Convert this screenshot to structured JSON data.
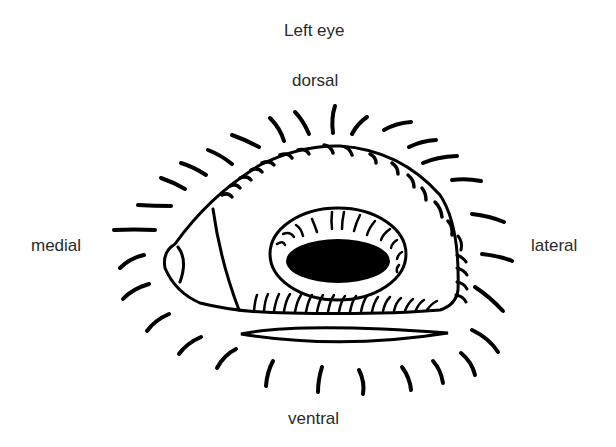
{
  "figure": {
    "title": "Left eye",
    "orientation_labels": {
      "top": "dorsal",
      "left": "medial",
      "right": "lateral",
      "bottom": "ventral"
    },
    "colors": {
      "ink": "#000000",
      "background": "#ffffff",
      "label_text": "#2a2a2a"
    },
    "parts": [
      "eyelid-outline",
      "medial-caruncle",
      "nictitating-fold",
      "palpebral-fissure",
      "pupil",
      "inner-lashes",
      "upper-lid-lashes",
      "lower-lid-lashes",
      "lateral-lid-lashes",
      "ventral-fold",
      "periocular-whiskers"
    ]
  }
}
